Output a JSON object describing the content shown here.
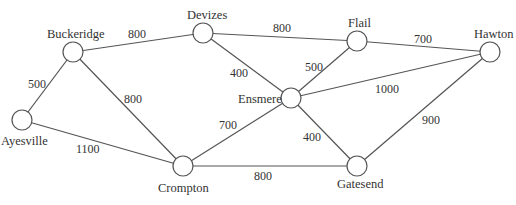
{
  "diagram": {
    "type": "weighted-undirected-graph",
    "nodes": [
      {
        "id": "Ayesville",
        "label": "Ayesville",
        "x": 22,
        "y": 120,
        "lx": 1,
        "ly": 145
      },
      {
        "id": "Buckeridge",
        "label": "Buckeridge",
        "x": 73,
        "y": 52,
        "lx": 47,
        "ly": 38
      },
      {
        "id": "Devizes",
        "label": "Devizes",
        "x": 203,
        "y": 33,
        "lx": 187,
        "ly": 19
      },
      {
        "id": "Flail",
        "label": "Flail",
        "x": 357,
        "y": 41,
        "lx": 348,
        "ly": 27
      },
      {
        "id": "Hawton",
        "label": "Hawton",
        "x": 490,
        "y": 52,
        "lx": 474,
        "ly": 38
      },
      {
        "id": "Ensmere",
        "label": "Ensmere",
        "x": 291,
        "y": 98,
        "lx": 238,
        "ly": 103
      },
      {
        "id": "Crompton",
        "label": "Crompton",
        "x": 183,
        "y": 166,
        "lx": 158,
        "ly": 192
      },
      {
        "id": "Gatesend",
        "label": "Gatesend",
        "x": 357,
        "y": 166,
        "lx": 337,
        "ly": 188
      }
    ],
    "edges": [
      {
        "from": "Ayesville",
        "to": "Buckeridge",
        "weight": "500",
        "wx": 28,
        "wy": 88
      },
      {
        "from": "Ayesville",
        "to": "Crompton",
        "weight": "1100",
        "wx": 76,
        "wy": 153
      },
      {
        "from": "Buckeridge",
        "to": "Devizes",
        "weight": "800",
        "wx": 128,
        "wy": 38
      },
      {
        "from": "Buckeridge",
        "to": "Crompton",
        "weight": "800",
        "wx": 124,
        "wy": 103
      },
      {
        "from": "Devizes",
        "to": "Flail",
        "weight": "800",
        "wx": 273,
        "wy": 32
      },
      {
        "from": "Devizes",
        "to": "Ensmere",
        "weight": "400",
        "wx": 230,
        "wy": 77
      },
      {
        "from": "Flail",
        "to": "Hawton",
        "weight": "700",
        "wx": 414,
        "wy": 43
      },
      {
        "from": "Flail",
        "to": "Ensmere",
        "weight": "500",
        "wx": 305,
        "wy": 71
      },
      {
        "from": "Ensmere",
        "to": "Hawton",
        "weight": "1000",
        "wx": 375,
        "wy": 93
      },
      {
        "from": "Ensmere",
        "to": "Crompton",
        "weight": "700",
        "wx": 219,
        "wy": 129
      },
      {
        "from": "Ensmere",
        "to": "Gatesend",
        "weight": "400",
        "wx": 303,
        "wy": 141
      },
      {
        "from": "Crompton",
        "to": "Gatesend",
        "weight": "800",
        "wx": 254,
        "wy": 180
      },
      {
        "from": "Gatesend",
        "to": "Hawton",
        "weight": "900",
        "wx": 422,
        "wy": 124
      }
    ]
  }
}
